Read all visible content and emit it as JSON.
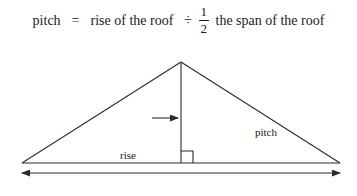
{
  "formula": {
    "terms": {
      "pitch": "pitch",
      "equals": "=",
      "rise_of_the_roof": "rise of the roof",
      "divide": "÷",
      "the_span_of_the_roof": "the span of the roof"
    },
    "fraction": {
      "numerator": "1",
      "denominator": "2"
    }
  },
  "diagram": {
    "type": "roof-triangle",
    "labels": {
      "rise": "rise",
      "pitch": "pitch",
      "span": "span"
    },
    "markers": {
      "right_angle": "right-angle-square",
      "rise_arrow": "arrow-right",
      "span_arrow": "double-headed-arrow"
    },
    "geometry": {
      "apex": [
        181,
        24
      ],
      "base_left": [
        22,
        125
      ],
      "base_right": [
        340,
        125
      ],
      "rise_line_x": 181,
      "span_arrow_y": 135
    },
    "colors": {
      "stroke": "#2b2b2b",
      "background": "#ffffff"
    }
  }
}
